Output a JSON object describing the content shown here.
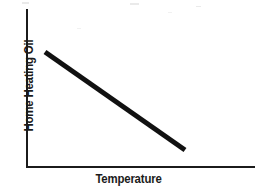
{
  "chart_data": {
    "type": "line",
    "title": "",
    "subtitle": "",
    "xlabel": "Temperature",
    "ylabel": "Home Heating Oil",
    "grid": false,
    "legend": null,
    "legend_position": "none",
    "xticks": [],
    "yticks": [],
    "xlim": [
      0,
      1
    ],
    "ylim": [
      0,
      1
    ],
    "annotations": [],
    "relationship": "inverse",
    "series": [
      {
        "name": "Home Heating Oil vs Temperature",
        "color": "#111111",
        "line_width_px": 5,
        "x": [
          0.12,
          1.0
        ],
        "y": [
          1.0,
          0.12
        ],
        "points_px": [
          {
            "x": 45,
            "y": 52
          },
          {
            "x": 185,
            "y": 150
          }
        ]
      }
    ]
  },
  "axes": {
    "y_axis": {
      "name": "y-axis-line",
      "color": "#1b1b1b",
      "x_px": 26,
      "top_px": 9,
      "bottom_px": 167
    },
    "x_axis": {
      "name": "x-axis-line",
      "color": "#1b1b1b",
      "y_px": 167,
      "left_px": 26,
      "right_px": 255
    }
  },
  "canvas": {
    "width": 257,
    "height": 189,
    "background": "#ffffff",
    "ink": "#1b1b1b"
  }
}
